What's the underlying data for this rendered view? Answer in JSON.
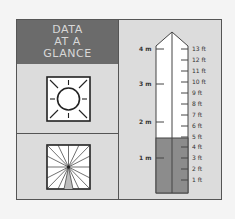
{
  "header": {
    "lines": [
      "DATA",
      "AT A",
      "GLANCE"
    ]
  },
  "icons": {
    "sun": "full-sun-icon",
    "shade": "shade-icon"
  },
  "ruler": {
    "meter_labels": [
      {
        "label": "4 m",
        "y": 48
      },
      {
        "label": "3 m",
        "y": 83
      },
      {
        "label": "2 m",
        "y": 121
      },
      {
        "label": "1 m",
        "y": 157
      }
    ],
    "feet_labels": [
      {
        "label": "13 ft",
        "y": 48
      },
      {
        "label": "12 ft",
        "y": 59
      },
      {
        "label": "11 ft",
        "y": 70
      },
      {
        "label": "10 ft",
        "y": 81
      },
      {
        "label": "9 ft",
        "y": 92
      },
      {
        "label": "8 ft",
        "y": 103
      },
      {
        "label": "7 ft",
        "y": 114
      },
      {
        "label": "6 ft",
        "y": 125
      },
      {
        "label": "5 ft",
        "y": 136
      },
      {
        "label": "4 ft",
        "y": 146
      },
      {
        "label": "3 ft",
        "y": 157
      },
      {
        "label": "2 ft",
        "y": 168
      },
      {
        "label": "1 ft",
        "y": 179
      }
    ],
    "fill_height_ft": 5,
    "colors": {
      "fill": "#8c8c8c",
      "empty": "#ffffff",
      "outline": "#444444"
    }
  },
  "colors": {
    "header_bg": "#6b6b6b",
    "header_text": "#d8d8d8",
    "panel_bg": "#dcdcdc",
    "page_bg": "#f4f4f4"
  }
}
